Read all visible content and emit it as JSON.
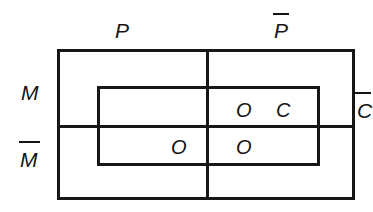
{
  "diagram": {
    "type": "logic-venn-karnaugh",
    "background_color": "#ffffff",
    "line_color": "#171717",
    "text_color": "#141414",
    "canvas": {
      "width": 373,
      "height": 212
    },
    "axis_labels": {
      "column_left": "P",
      "column_right": "P",
      "column_right_overbar": true,
      "row_top": "M",
      "row_bottom": "M",
      "row_bottom_overbar": true,
      "inner_complement": "C",
      "inner_complement_overbar": true
    },
    "marks": [
      {
        "id": "o-top-right",
        "text": "O",
        "row": "M",
        "column": "P-bar",
        "inside_c": true
      },
      {
        "id": "c-top-right",
        "text": "C",
        "row": "M",
        "column": "P-bar",
        "inside_c": true
      },
      {
        "id": "o-bottom-left",
        "text": "O",
        "row": "M-bar",
        "column": "P",
        "inside_c": true
      },
      {
        "id": "o-bottom-right",
        "text": "O",
        "row": "M-bar",
        "column": "P-bar",
        "inside_c": true
      }
    ]
  }
}
